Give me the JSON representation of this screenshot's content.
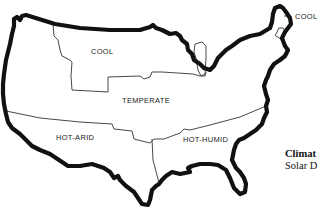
{
  "map": {
    "subject": "United States climate zones",
    "regions": [
      {
        "id": "cool-north",
        "label": "COOL"
      },
      {
        "id": "cool-northeast",
        "label": "COOL"
      },
      {
        "id": "temperate",
        "label": "TEMPERATE"
      },
      {
        "id": "hot-arid",
        "label": "HOT-ARID"
      },
      {
        "id": "hot-humid",
        "label": "HOT-HUMID"
      }
    ],
    "colors": {
      "outline": "#111111",
      "boundary": "#333333",
      "background": "#ffffff"
    }
  },
  "caption": {
    "title": "Climat",
    "subtitle": "Solar D"
  }
}
